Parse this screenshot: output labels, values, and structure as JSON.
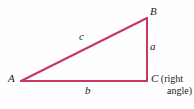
{
  "figure": {
    "kind": "right-triangle-diagram",
    "background_color": "#fefefe",
    "stroke_color": "#c8385a",
    "label_color": "#1a1a1a"
  },
  "vertices": {
    "A": {
      "label": "A",
      "x": 21,
      "y": 81
    },
    "B": {
      "label": "B",
      "x": 147,
      "y": 18
    },
    "C": {
      "label": "C",
      "x": 147,
      "y": 81
    }
  },
  "sides": {
    "a": {
      "label": "a",
      "description": "vertical leg from B to C"
    },
    "b": {
      "label": "b",
      "description": "horizontal leg from A to C"
    },
    "c": {
      "label": "c",
      "description": "hypotenuse from A to B"
    }
  },
  "annotation": {
    "paren_open": "(",
    "word_right": "right",
    "word_angle": "angle",
    "paren_close": ")",
    "line1": "C (right",
    "line2": "angle)"
  }
}
